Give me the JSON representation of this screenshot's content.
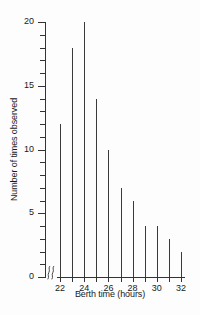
{
  "chart_data": {
    "type": "bar",
    "title": "",
    "subtitle": "",
    "xlabel": "Berth time (hours)",
    "ylabel": "Number of times observed",
    "categories": [
      22,
      23,
      24,
      25,
      26,
      27,
      28,
      29,
      30,
      31,
      32
    ],
    "values": [
      12,
      18,
      20,
      14,
      10,
      7,
      6,
      4,
      4,
      3,
      2
    ],
    "series": [
      {
        "name": "Number of times observed",
        "values": [
          12,
          18,
          20,
          14,
          10,
          7,
          6,
          4,
          4,
          3,
          2
        ]
      }
    ],
    "xlim": [
      21.6,
      32.4
    ],
    "ylim": [
      0,
      20
    ],
    "x_tick_values": [
      22,
      23,
      24,
      25,
      26,
      27,
      28,
      29,
      30,
      31,
      32
    ],
    "x_tick_labels": [
      "22",
      "",
      "24",
      "",
      "26",
      "",
      "28",
      "",
      "30",
      "",
      "32"
    ],
    "y_tick_values": [
      0,
      1,
      2,
      3,
      4,
      5,
      6,
      7,
      8,
      9,
      10,
      11,
      12,
      13,
      14,
      15,
      16,
      17,
      18,
      19,
      20
    ],
    "y_major_ticks": [
      0,
      5,
      10,
      15,
      20
    ],
    "y_tick_labels": [
      "0",
      "5",
      "10",
      "15",
      "20"
    ],
    "grid": false,
    "legend": false,
    "legend_position": "none",
    "axis_break": true,
    "axis_break_axis": "x",
    "annotations": [],
    "colors": {
      "background": "#fdfdfd",
      "axis": "#333333",
      "bar": "#3a3a3a",
      "text": "#1a1a1a"
    }
  }
}
